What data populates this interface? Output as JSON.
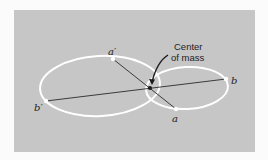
{
  "figure": {
    "colors": {
      "background": "#fbfbfb",
      "panel": "#c6c6c6",
      "orbit": "#ffffff",
      "line": "#2a2a2a",
      "text": "#1e1e1e"
    },
    "annotation": {
      "line1": "Center",
      "line2": "of mass"
    },
    "points": {
      "a_prime": "a′",
      "b_prime": "b′",
      "a": "a",
      "b": "b"
    },
    "icons": {
      "annotation_arrow": "curved-arrow-icon",
      "center_marker": "dot-icon"
    }
  }
}
